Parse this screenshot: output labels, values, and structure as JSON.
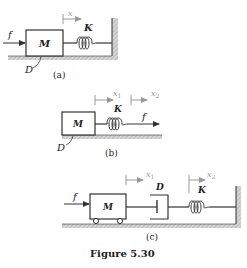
{
  "figure": {
    "caption": "Figure 5.30",
    "colors": {
      "line": "#333333",
      "ground": "#c8c8c8",
      "displacement_arrow": "#a0a0a0"
    }
  },
  "panel_a": {
    "label": "(a)",
    "mass": "M",
    "spring": "K",
    "damping": "D",
    "force": "f",
    "displacement": "x"
  },
  "panel_b": {
    "label": "(b)",
    "mass": "M",
    "spring": "K",
    "damping": "D",
    "force": "f",
    "displacement_1": "x",
    "displacement_1_sub": "1",
    "displacement_2": "x",
    "displacement_2_sub": "2"
  },
  "panel_c": {
    "label": "(c)",
    "mass": "M",
    "spring": "K",
    "damper": "D",
    "force": "f",
    "displacement_1": "x",
    "displacement_1_sub": "1",
    "displacement_2": "x",
    "displacement_2_sub": "2"
  }
}
